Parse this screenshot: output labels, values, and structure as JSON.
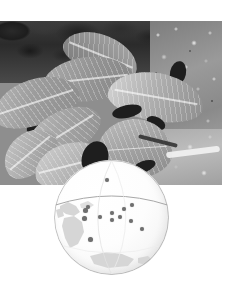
{
  "figure": {
    "caption": "",
    "photograph": {
      "subject": "compound leaves on branch",
      "palette": "grayscale",
      "frame": {
        "left": 0,
        "top": 21,
        "width": 222,
        "height": 164
      }
    },
    "globe_overlay": {
      "label": "",
      "center_x": 111,
      "center_y": 217,
      "radius": 57,
      "equator_label": "",
      "graticule": true,
      "continents_visible": [
        "Americas",
        "Antarctica",
        "Australia"
      ],
      "point_color": "#6f6f6f",
      "sphere_color": "#fbfbfb",
      "outline_color": "#9a9a9a",
      "points": [
        {
          "x": 53,
          "y": 20,
          "size": 4
        },
        {
          "x": 31,
          "y": 50,
          "size": 5
        },
        {
          "x": 34,
          "y": 47,
          "size": 4
        },
        {
          "x": 30,
          "y": 58,
          "size": 5
        },
        {
          "x": 46,
          "y": 57,
          "size": 4
        },
        {
          "x": 58,
          "y": 53,
          "size": 4
        },
        {
          "x": 58,
          "y": 60,
          "size": 4
        },
        {
          "x": 66,
          "y": 57,
          "size": 4
        },
        {
          "x": 70,
          "y": 49,
          "size": 4
        },
        {
          "x": 78,
          "y": 45,
          "size": 4
        },
        {
          "x": 77,
          "y": 61,
          "size": 4
        },
        {
          "x": 88,
          "y": 69,
          "size": 4
        },
        {
          "x": 36,
          "y": 79,
          "size": 5
        }
      ]
    }
  }
}
